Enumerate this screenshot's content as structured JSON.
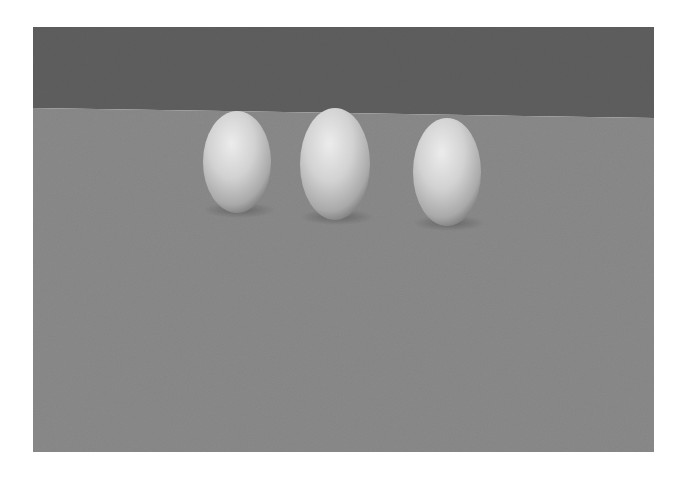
{
  "scene": {
    "description": "Rendered grayscale 3D scene of three egg-shaped ellipsoids resting on a flat gray floor in front of a dark gray wall",
    "colors": {
      "wall": "#5f5f5f",
      "floor": "#8a8a8a",
      "object_highlight": "#e6e6e6",
      "object_mid": "#bdbdbd",
      "object_shadow": "#6e6e6e"
    },
    "objects": [
      {
        "label": "egg-1",
        "cx": 204,
        "cy": 135,
        "rx": 34,
        "ry": 51
      },
      {
        "label": "egg-2",
        "cx": 302,
        "cy": 137,
        "rx": 35,
        "ry": 56
      },
      {
        "label": "egg-3",
        "cx": 414,
        "cy": 145,
        "rx": 34,
        "ry": 54
      }
    ]
  }
}
